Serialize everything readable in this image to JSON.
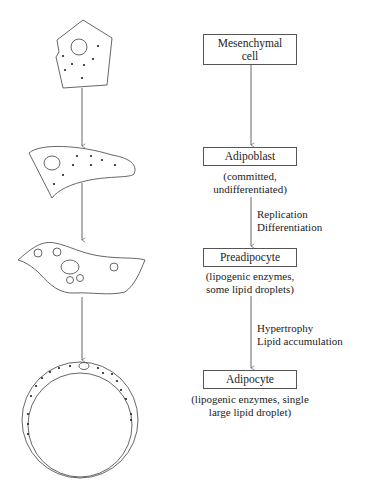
{
  "stages": [
    {
      "label": "Mesenchymal cell",
      "label_lines": [
        "Mesenchymal",
        "cell"
      ],
      "note_lines": []
    },
    {
      "label": "Adipoblast",
      "label_lines": [
        "Adipoblast"
      ],
      "note_lines": [
        "(committed,",
        "undifferentiated)"
      ]
    },
    {
      "label": "Preadipocyte",
      "label_lines": [
        "Preadipocyte"
      ],
      "note_lines": [
        "(lipogenic enzymes,",
        "some lipid droplets)"
      ]
    },
    {
      "label": "Adipocyte",
      "label_lines": [
        "Adipocyte"
      ],
      "note_lines": [
        "(lipogenic enzymes, single",
        "large lipid droplet)"
      ]
    }
  ],
  "transitions": [
    {
      "from": "Mesenchymal cell",
      "to": "Adipoblast",
      "label_lines": []
    },
    {
      "from": "Adipoblast",
      "to": "Preadipocyte",
      "label_lines": [
        "Replication",
        "Differentiation"
      ]
    },
    {
      "from": "Preadipocyte",
      "to": "Adipocyte",
      "label_lines": [
        "Hypertrophy",
        "Lipid accumulation"
      ]
    }
  ],
  "colors": {
    "line": "#555555",
    "text": "#222222",
    "background": "#ffffff"
  }
}
